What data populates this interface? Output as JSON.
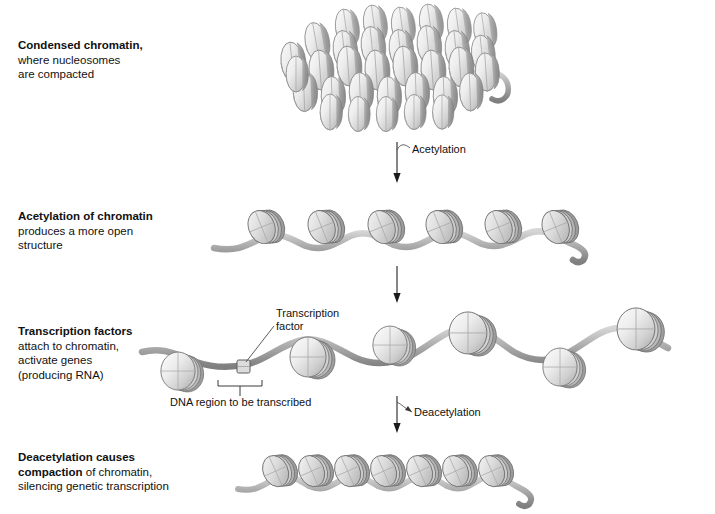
{
  "figure": {
    "background_color": "#ffffff",
    "text_color": "#111111",
    "nucleosome_fill_light": "#f0f0f0",
    "nucleosome_fill_mid": "#c9c9c9",
    "nucleosome_fill_dark": "#8d8d8d",
    "dna_strand_color": "#9a9a9a",
    "outline_color": "#6e6e6e"
  },
  "captions": [
    {
      "id": "condensed-chromatin",
      "bold": "Condensed chromatin,",
      "lines": [
        "where nucleosomes",
        "are compacted"
      ],
      "x": 18,
      "y": 38
    },
    {
      "id": "acetylation-of-chromatin",
      "bold": "Acetylation of chromatin",
      "lines": [
        "produces a more open",
        "structure"
      ],
      "x": 18,
      "y": 209
    },
    {
      "id": "transcription-factors",
      "bold": "Transcription factors",
      "lines": [
        "attach to chromatin,",
        "activate genes",
        "(producing RNA)"
      ],
      "x": 18,
      "y": 324
    },
    {
      "id": "deacetylation-causes",
      "bold": "Deacetylation causes",
      "bold2": "compaction",
      "rest2": " of chromatin,",
      "lines": [
        "silencing genetic transcription"
      ],
      "x": 18,
      "y": 450
    }
  ],
  "annotations": {
    "acetylation_label": "Acetylation",
    "deacetylation_label": "Deacetylation",
    "transcription_factor_label_line1": "Transcription",
    "transcription_factor_label_line2": "factor",
    "dna_region_label": "DNA region to be transcribed"
  },
  "arrows": [
    {
      "id": "arrow-acetylation",
      "x": 397,
      "y1": 142,
      "y2": 182,
      "label": "Acetylation"
    },
    {
      "id": "arrow-unlabeled",
      "x": 397,
      "y1": 264,
      "y2": 302,
      "label": ""
    },
    {
      "id": "arrow-deacetylation",
      "x": 397,
      "y1": 396,
      "y2": 432,
      "label": "Deacetylation"
    }
  ],
  "rows": [
    {
      "id": "row-condensed-chromatin",
      "state": "condensed",
      "nucleosome_count": 34,
      "description": "Dense three-dimensional cluster of stacked nucleosome ellipsoids with a short DNA tail at right"
    },
    {
      "id": "row-acetylated-chromatin",
      "state": "acetylated-open",
      "nucleosome_count": 6,
      "description": "Open helical array of tilted nucleosome discs linked by a wavy DNA strand"
    },
    {
      "id": "row-transcription-factors",
      "state": "transcription-active",
      "nucleosome_count": 7,
      "description": "Beads-on-a-string with widely spaced round nucleosomes on an undulating DNA strand, transcription factor bound at an exposed DNA region"
    },
    {
      "id": "row-deacetylated-chromatin",
      "state": "deacetylated-compacted",
      "nucleosome_count": 7,
      "description": "Re-compacted helical array of tightly packed nucleosome discs"
    }
  ]
}
